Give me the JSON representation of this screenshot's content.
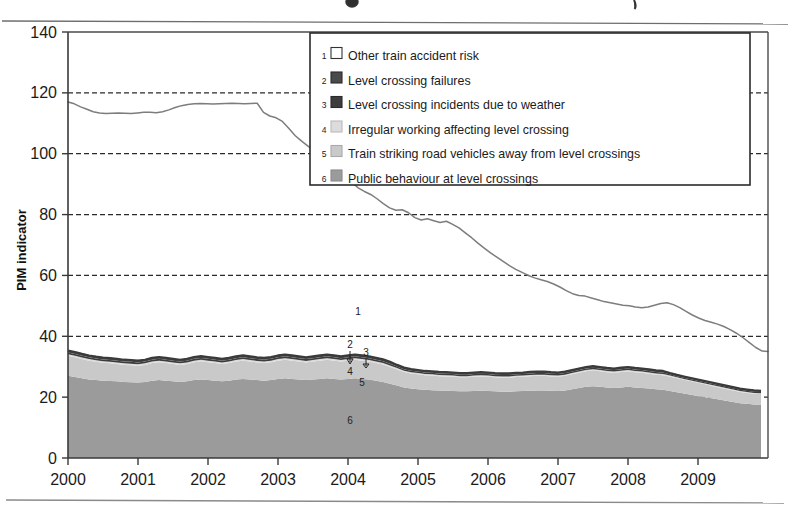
{
  "chart_data": {
    "type": "area",
    "title": "",
    "xlabel": "",
    "ylabel": "PIM indicator",
    "xlim": [
      2000,
      2010
    ],
    "ylim": [
      0,
      140
    ],
    "ytick_values": [
      0,
      20,
      40,
      60,
      80,
      100,
      120,
      140
    ],
    "ytick_labels": [
      "0",
      "20",
      "40",
      "60",
      "80",
      "100",
      "120",
      "140"
    ],
    "xtick_values": [
      2000,
      2001,
      2002,
      2003,
      2004,
      2005,
      2006,
      2007,
      2008,
      2009
    ],
    "xtick_labels": [
      "2000",
      "2001",
      "2002",
      "2003",
      "2004",
      "2005",
      "2006",
      "2007",
      "2008",
      "2009"
    ],
    "grid": "horizontal-dashed",
    "legend_position": "top-right-inside",
    "stacked": true,
    "x": [
      2000.0,
      2000.1,
      2000.2,
      2000.3,
      2000.4,
      2000.5,
      2000.6,
      2000.7,
      2000.8,
      2000.9,
      2001.0,
      2001.1,
      2001.2,
      2001.3,
      2001.4,
      2001.5,
      2001.6,
      2001.7,
      2001.8,
      2001.9,
      2002.0,
      2002.1,
      2002.2,
      2002.3,
      2002.4,
      2002.5,
      2002.6,
      2002.7,
      2002.8,
      2002.9,
      2003.0,
      2003.1,
      2003.2,
      2003.3,
      2003.4,
      2003.5,
      2003.6,
      2003.7,
      2003.8,
      2003.9,
      2004.0,
      2004.1,
      2004.2,
      2004.3,
      2004.4,
      2004.5,
      2004.6,
      2004.7,
      2004.8,
      2004.9,
      2005.0,
      2005.1,
      2005.2,
      2005.3,
      2005.4,
      2005.5,
      2005.6,
      2005.7,
      2005.8,
      2005.9,
      2006.0,
      2006.1,
      2006.2,
      2006.3,
      2006.4,
      2006.5,
      2006.6,
      2006.7,
      2006.8,
      2006.9,
      2007.0,
      2007.1,
      2007.2,
      2007.3,
      2007.4,
      2007.5,
      2007.6,
      2007.7,
      2007.8,
      2007.9,
      2008.0,
      2008.1,
      2008.2,
      2008.3,
      2008.4,
      2008.5,
      2008.6,
      2008.7,
      2008.8,
      2008.9,
      2009.0,
      2009.1,
      2009.2,
      2009.3,
      2009.4,
      2009.5,
      2009.6,
      2009.7,
      2009.8,
      2009.9
    ],
    "series": [
      {
        "name": "Public behaviour at level crossings",
        "legend_index": 6,
        "color": "#9b9b9b",
        "values": [
          27.0,
          26.6,
          26.2,
          25.8,
          25.6,
          25.4,
          25.3,
          25.2,
          25.0,
          24.9,
          24.8,
          25.0,
          25.4,
          25.6,
          25.4,
          25.2,
          25.0,
          25.2,
          25.6,
          25.8,
          25.6,
          25.4,
          25.2,
          25.4,
          25.8,
          26.0,
          25.8,
          25.6,
          25.4,
          25.6,
          26.0,
          26.2,
          26.0,
          25.8,
          25.6,
          25.8,
          26.0,
          26.2,
          26.0,
          25.8,
          26.0,
          26.2,
          26.0,
          25.8,
          25.4,
          25.0,
          24.4,
          23.8,
          23.2,
          22.8,
          22.6,
          22.4,
          22.3,
          22.2,
          22.1,
          22.0,
          21.9,
          21.9,
          22.0,
          22.1,
          22.0,
          21.9,
          21.8,
          21.8,
          21.9,
          22.0,
          22.1,
          22.2,
          22.2,
          22.1,
          22.0,
          22.2,
          22.6,
          23.0,
          23.4,
          23.6,
          23.4,
          23.2,
          23.0,
          23.2,
          23.4,
          23.2,
          23.0,
          22.8,
          22.6,
          22.4,
          22.0,
          21.6,
          21.2,
          20.8,
          20.4,
          20.0,
          19.6,
          19.2,
          18.8,
          18.4,
          18.0,
          17.8,
          17.6,
          17.6
        ]
      },
      {
        "name": "Train striking road vehicles away from level crossings",
        "legend_index": 5,
        "color": "#c9c9c9",
        "values": [
          6.6,
          6.5,
          6.3,
          6.2,
          6.0,
          5.9,
          5.8,
          5.7,
          5.6,
          5.6,
          5.5,
          5.6,
          5.8,
          5.9,
          5.8,
          5.7,
          5.6,
          5.7,
          5.9,
          6.0,
          5.9,
          5.8,
          5.7,
          5.8,
          5.9,
          6.0,
          5.9,
          5.8,
          5.8,
          5.9,
          6.0,
          6.1,
          6.0,
          5.9,
          5.8,
          5.9,
          6.0,
          6.1,
          6.0,
          5.9,
          6.0,
          6.1,
          6.0,
          5.9,
          5.8,
          5.7,
          5.5,
          5.3,
          5.1,
          5.0,
          4.9,
          4.8,
          4.8,
          4.7,
          4.7,
          4.7,
          4.6,
          4.6,
          4.7,
          4.7,
          4.7,
          4.6,
          4.6,
          4.6,
          4.7,
          4.7,
          4.8,
          4.8,
          4.8,
          4.7,
          4.7,
          4.8,
          4.9,
          5.0,
          5.1,
          5.2,
          5.1,
          5.0,
          5.0,
          5.1,
          5.1,
          5.0,
          5.0,
          4.9,
          4.8,
          4.8,
          4.7,
          4.6,
          4.5,
          4.4,
          4.3,
          4.2,
          4.1,
          4.0,
          3.9,
          3.8,
          3.7,
          3.6,
          3.5,
          3.4
        ]
      },
      {
        "name": "Irregular working affecting level crossing",
        "legend_index": 4,
        "color": "#dcdcdc",
        "values": [
          0.5,
          0.5,
          0.5,
          0.5,
          0.5,
          0.5,
          0.5,
          0.5,
          0.5,
          0.5,
          0.5,
          0.5,
          0.5,
          0.5,
          0.5,
          0.5,
          0.5,
          0.5,
          0.5,
          0.5,
          0.5,
          0.5,
          0.5,
          0.5,
          0.5,
          0.5,
          0.5,
          0.5,
          0.5,
          0.5,
          0.5,
          0.5,
          0.5,
          0.5,
          0.5,
          0.5,
          0.5,
          0.5,
          0.5,
          0.5,
          0.5,
          0.5,
          0.5,
          0.5,
          0.5,
          0.5,
          0.5,
          0.5,
          0.4,
          0.4,
          0.4,
          0.4,
          0.4,
          0.4,
          0.4,
          0.4,
          0.4,
          0.4,
          0.4,
          0.4,
          0.4,
          0.4,
          0.4,
          0.4,
          0.4,
          0.4,
          0.4,
          0.4,
          0.4,
          0.4,
          0.4,
          0.4,
          0.4,
          0.4,
          0.4,
          0.4,
          0.4,
          0.4,
          0.4,
          0.4,
          0.4,
          0.4,
          0.4,
          0.4,
          0.4,
          0.4,
          0.4,
          0.3,
          0.3,
          0.3,
          0.3,
          0.3,
          0.3,
          0.3,
          0.3,
          0.3,
          0.3,
          0.3,
          0.3,
          0.3
        ]
      },
      {
        "name": "Level crossing incidents due to weather",
        "legend_index": 3,
        "color": "#3d3d3d",
        "values": [
          0.6,
          0.6,
          0.6,
          0.6,
          0.6,
          0.6,
          0.6,
          0.6,
          0.6,
          0.6,
          0.6,
          0.6,
          0.6,
          0.6,
          0.6,
          0.6,
          0.6,
          0.6,
          0.6,
          0.6,
          0.6,
          0.6,
          0.6,
          0.6,
          0.6,
          0.6,
          0.6,
          0.6,
          0.6,
          0.6,
          0.6,
          0.6,
          0.6,
          0.6,
          0.6,
          0.6,
          0.6,
          0.6,
          0.6,
          0.6,
          0.6,
          0.6,
          0.6,
          0.6,
          0.6,
          0.6,
          0.6,
          0.5,
          0.5,
          0.5,
          0.5,
          0.5,
          0.5,
          0.5,
          0.5,
          0.5,
          0.5,
          0.5,
          0.5,
          0.5,
          0.5,
          0.5,
          0.5,
          0.5,
          0.5,
          0.5,
          0.5,
          0.5,
          0.5,
          0.5,
          0.5,
          0.5,
          0.5,
          0.5,
          0.5,
          0.5,
          0.5,
          0.5,
          0.5,
          0.5,
          0.5,
          0.5,
          0.5,
          0.5,
          0.5,
          0.5,
          0.4,
          0.4,
          0.4,
          0.4,
          0.4,
          0.4,
          0.4,
          0.4,
          0.4,
          0.4,
          0.4,
          0.4,
          0.4,
          0.4
        ]
      },
      {
        "name": "Level crossing failures",
        "legend_index": 2,
        "color": "#4a4a4a",
        "values": [
          0.6,
          0.6,
          0.6,
          0.6,
          0.6,
          0.6,
          0.6,
          0.6,
          0.6,
          0.6,
          0.6,
          0.6,
          0.6,
          0.6,
          0.6,
          0.6,
          0.6,
          0.6,
          0.6,
          0.6,
          0.6,
          0.6,
          0.6,
          0.6,
          0.6,
          0.6,
          0.6,
          0.6,
          0.6,
          0.6,
          0.6,
          0.6,
          0.6,
          0.6,
          0.6,
          0.6,
          0.6,
          0.6,
          0.6,
          0.6,
          0.6,
          0.6,
          0.6,
          0.6,
          0.6,
          0.6,
          0.6,
          0.5,
          0.5,
          0.5,
          0.5,
          0.5,
          0.5,
          0.5,
          0.5,
          0.5,
          0.5,
          0.5,
          0.5,
          0.5,
          0.5,
          0.5,
          0.5,
          0.5,
          0.5,
          0.5,
          0.5,
          0.5,
          0.5,
          0.5,
          0.5,
          0.5,
          0.5,
          0.5,
          0.5,
          0.5,
          0.5,
          0.5,
          0.5,
          0.5,
          0.5,
          0.5,
          0.5,
          0.5,
          0.5,
          0.5,
          0.4,
          0.4,
          0.4,
          0.4,
          0.4,
          0.4,
          0.4,
          0.4,
          0.4,
          0.4,
          0.4,
          0.4,
          0.4,
          0.4
        ]
      }
    ],
    "total_line": {
      "name": "Total (top of Other train accident risk)",
      "legend_index": 1,
      "color": "#7d7d7d",
      "values": [
        117.0,
        116.4,
        115.4,
        114.6,
        113.8,
        113.4,
        113.2,
        113.3,
        113.4,
        113.3,
        113.2,
        113.4,
        113.6,
        113.6,
        113.5,
        113.8,
        114.4,
        115.2,
        115.8,
        116.2,
        116.4,
        116.5,
        116.4,
        116.3,
        116.4,
        116.5,
        116.6,
        116.5,
        116.4,
        116.5,
        116.6,
        113.6,
        112.4,
        111.8,
        110.6,
        108.4,
        106.0,
        104.2,
        102.6,
        101.0,
        99.6,
        98.0,
        96.2,
        94.4,
        92.6,
        90.6,
        88.8,
        87.6,
        86.6,
        85.2,
        83.6,
        82.2,
        81.4,
        81.6,
        80.6,
        79.0,
        78.2,
        78.6,
        78.0,
        77.4,
        77.8,
        76.8,
        75.6,
        74.0,
        72.4,
        70.6,
        69.0,
        67.4,
        66.0,
        64.6,
        63.2,
        62.0,
        61.0,
        60.0,
        59.2,
        58.6,
        58.0,
        57.2,
        56.2,
        55.0,
        54.0,
        53.4,
        53.2,
        52.6,
        52.0,
        51.4,
        51.0,
        50.6,
        50.2,
        50.0,
        49.6,
        49.4,
        49.6,
        50.2,
        50.8,
        51.0,
        50.4,
        49.4,
        48.2,
        47.0
      ],
      "values_tail": [
        46.0,
        45.2,
        44.6,
        44.0,
        43.2,
        42.2,
        41.0,
        39.6,
        38.0,
        36.4,
        35.2,
        35.0
      ]
    },
    "plot_annotations": [
      {
        "label": "1",
        "series": "Other train accident risk"
      },
      {
        "label": "2",
        "series": "Level crossing failures"
      },
      {
        "label": "3",
        "series": "Level crossing incidents due to weather"
      },
      {
        "label": "4",
        "series": "Irregular working affecting level crossing"
      },
      {
        "label": "5",
        "series": "Train striking road vehicles away from level crossings"
      },
      {
        "label": "6",
        "series": "Public behaviour at level crossings"
      }
    ]
  },
  "legend": {
    "items": [
      {
        "number": "1",
        "label": "Other train accident risk",
        "swatch": "#ffffff",
        "outline": "#333333"
      },
      {
        "number": "2",
        "label": "Level crossing failures",
        "swatch": "#4a4a4a",
        "outline": "#2a2a2a"
      },
      {
        "number": "3",
        "label": "Level crossing incidents due to weather",
        "swatch": "#3d3d3d",
        "outline": "#2a2a2a"
      },
      {
        "number": "4",
        "label": "Irregular working affecting level crossing",
        "swatch": "#dcdcdc",
        "outline": "#bbbbbb"
      },
      {
        "number": "5",
        "label": "Train striking road vehicles away from level crossings",
        "swatch": "#c9c9c9",
        "outline": "#aaaaaa"
      },
      {
        "number": "6",
        "label": "Public behaviour at level crossings",
        "swatch": "#9b9b9b",
        "outline": "#8a8a8a"
      }
    ]
  },
  "axes": {
    "ylabel": "PIM indicator",
    "ylabels": [
      "140",
      "120",
      "100",
      "80",
      "60",
      "40",
      "20",
      "0"
    ],
    "xlabels": [
      "2000",
      "2001",
      "2002",
      "2003",
      "2004",
      "2005",
      "2006",
      "2007",
      "2008",
      "2009"
    ]
  },
  "annotations": {
    "n1": "1",
    "n2": "2",
    "n3": "3",
    "n4": "4",
    "n5": "5",
    "n6": "6"
  }
}
